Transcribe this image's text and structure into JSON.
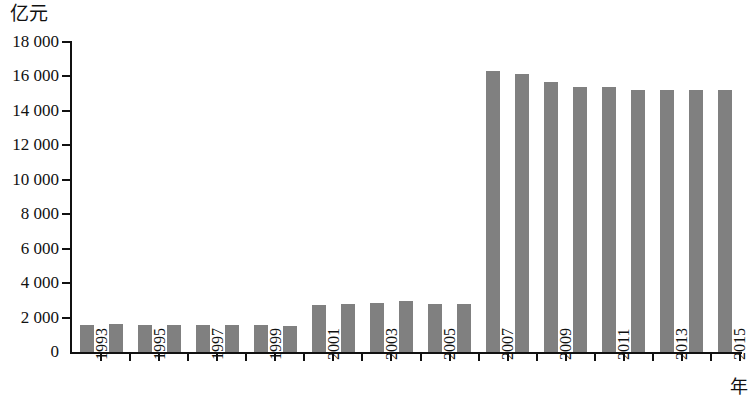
{
  "chart_data": {
    "type": "bar",
    "title": "",
    "subtitle": "",
    "xlabel": "年",
    "ylabel": "亿元",
    "ylim": [
      0,
      18000
    ],
    "ytick_step": 2000,
    "ytick_labels": [
      "0",
      "2 000",
      "4 000",
      "6 000",
      "8 000",
      "10 000",
      "12 000",
      "14 000",
      "16 000",
      "18 000"
    ],
    "ytick_values": [
      0,
      2000,
      4000,
      6000,
      8000,
      10000,
      12000,
      14000,
      16000,
      18000
    ],
    "grid": false,
    "legend": null,
    "bar_color": "#808080",
    "axis_color": "#111111",
    "categories": [
      "1993",
      "1994",
      "1995",
      "1996",
      "1997",
      "1998",
      "1999",
      "2000",
      "2001",
      "2002",
      "2003",
      "2004",
      "2005",
      "2006",
      "2007",
      "2008",
      "2009",
      "2010",
      "2011",
      "2012",
      "2013",
      "2014",
      "2015"
    ],
    "xtick_labels_shown": [
      "1993",
      "1995",
      "1997",
      "1999",
      "2001",
      "2003",
      "2005",
      "2007",
      "2009",
      "2011",
      "2013",
      "2015"
    ],
    "values": [
      1550,
      1600,
      1560,
      1540,
      1540,
      1540,
      1540,
      1520,
      2720,
      2790,
      2860,
      2960,
      2790,
      2760,
      16300,
      16150,
      15650,
      15400,
      15400,
      15200,
      15200,
      15200,
      15200
    ],
    "series": [
      {
        "name": "",
        "values": [
          1550,
          1600,
          1560,
          1540,
          1540,
          1540,
          1540,
          1520,
          2720,
          2790,
          2860,
          2960,
          2790,
          2760,
          16300,
          16150,
          15650,
          15400,
          15400,
          15200,
          15200,
          15200,
          15200
        ]
      }
    ]
  }
}
